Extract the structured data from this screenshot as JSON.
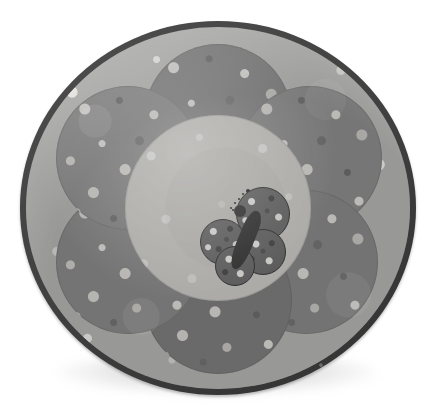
{
  "scene": {
    "title": "Round quilted polka-dot flower play mat with butterfly applique",
    "alt_text": "Circular grey polka dot baby play mat with a six petal flower and a butterfly applique in the centre",
    "background_color": "#ffffff",
    "canvas": {
      "width": 445,
      "height": 418
    }
  },
  "mat": {
    "name": "round-play-mat",
    "shape": "circle",
    "diameter_px": 396,
    "center": {
      "x": 218,
      "y": 208
    },
    "binding": {
      "label": "Binding trim",
      "color": "#3b3b3b",
      "width_px": 6
    },
    "field": {
      "label": "Polka dot outer field",
      "color": "#b6b6b4",
      "dot_color_light": "#f1f0ed",
      "dot_color_dark": "#8a8a88"
    },
    "shadow": {
      "label": "Drop shadow",
      "color": "rgba(120,120,120,0.42)"
    }
  },
  "flower": {
    "label": "Six petal flower",
    "petal_count": 6,
    "petals": [
      {
        "id": "petal-top",
        "label": "Top petal",
        "color": "#848484",
        "cx": 218,
        "cy": 118,
        "r": 74
      },
      {
        "id": "petal-upper-right",
        "label": "Upper right petal",
        "color": "#8d8d8d",
        "cx": 310,
        "cy": 158,
        "r": 72
      },
      {
        "id": "petal-lower-right",
        "label": "Lower right petal",
        "color": "#8a8a8a",
        "cx": 306,
        "cy": 262,
        "r": 72
      },
      {
        "id": "petal-bottom",
        "label": "Bottom petal",
        "color": "#7f7f7f",
        "cx": 218,
        "cy": 300,
        "r": 74
      },
      {
        "id": "petal-lower-left",
        "label": "Lower left petal",
        "color": "#8b8b8b",
        "cx": 128,
        "cy": 262,
        "r": 72
      },
      {
        "id": "petal-upper-left",
        "label": "Upper left petal",
        "color": "#8e8e8e",
        "cx": 128,
        "cy": 158,
        "r": 72
      }
    ],
    "center": {
      "id": "flower-center",
      "label": "Flower centre circle",
      "color": "#cdccc8",
      "cx": 218,
      "cy": 208,
      "r": 93
    }
  },
  "butterfly": {
    "label": "Butterfly applique",
    "body_color": "#3a3a3a",
    "wing_color": "#6e6e6e",
    "outline_color": "#383838",
    "position": {
      "x": 200,
      "y": 185
    },
    "wings": [
      {
        "id": "wing-upper-right",
        "label": "Upper right wing",
        "cx": 62,
        "cy": 28,
        "r": 26
      },
      {
        "id": "wing-lower-right",
        "label": "Lower right wing",
        "cx": 62,
        "cy": 66,
        "r": 22
      },
      {
        "id": "wing-upper-left",
        "label": "Upper left wing",
        "cx": 22,
        "cy": 56,
        "r": 22
      },
      {
        "id": "wing-lower-left",
        "label": "Lower left wing",
        "cx": 34,
        "cy": 80,
        "r": 19
      }
    ],
    "antennae": [
      {
        "id": "antenna-left",
        "label": "Left antenna",
        "segments": 5,
        "angle_deg": -48
      },
      {
        "id": "antenna-right",
        "label": "Right antenna",
        "segments": 5,
        "angle_deg": -22
      }
    ]
  }
}
